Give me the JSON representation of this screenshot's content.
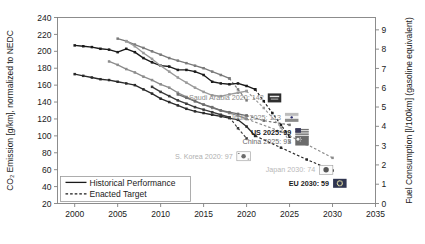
{
  "chart_data": {
    "type": "line",
    "title": "",
    "xlabel": "",
    "ylabel": "CO₂ Emission [g/km], normalized to NEDC",
    "y2label": "Fuel Consumption [l/100km] (gasoline equivalent)",
    "xlim": [
      1998,
      2035
    ],
    "ylim": [
      20,
      240
    ],
    "y2lim": [
      0,
      9.64
    ],
    "grid": false,
    "legend_position": "bottom-left",
    "xticks": [
      2000,
      2005,
      2010,
      2015,
      2020,
      2025,
      2030,
      2035
    ],
    "yticks": [
      20,
      40,
      60,
      80,
      100,
      120,
      140,
      160,
      180,
      200,
      220,
      240
    ],
    "y2ticks": [
      0,
      1,
      2,
      3,
      4,
      5,
      6,
      7,
      8,
      9
    ],
    "legend": [
      {
        "label": "Historical Performance",
        "style": "solid"
      },
      {
        "label": "Enacted Target",
        "style": "dashed"
      }
    ],
    "series": [
      {
        "name": "Saudi Arabia",
        "color": "#7a7a7a",
        "historical": {
          "x": [
            2005,
            2006,
            2007,
            2008,
            2009,
            2010,
            2011,
            2012,
            2013,
            2014,
            2015,
            2016,
            2017,
            2018
          ],
          "y": [
            215,
            212,
            208,
            204,
            200,
            196,
            192,
            189,
            186,
            183,
            180,
            176,
            172,
            168
          ]
        },
        "target": {
          "x": [
            2018,
            2019,
            2020
          ],
          "y": [
            168,
            155,
            142
          ]
        }
      },
      {
        "name": "US",
        "color": "#1a1a1a",
        "historical": {
          "x": [
            2000,
            2001,
            2002,
            2003,
            2004,
            2005,
            2006,
            2007,
            2008,
            2009,
            2010,
            2011,
            2012,
            2013,
            2014,
            2015,
            2016,
            2017,
            2018,
            2019,
            2020,
            2021
          ],
          "y": [
            207,
            206,
            205,
            203,
            202,
            199,
            203,
            199,
            192,
            187,
            183,
            182,
            178,
            178,
            176,
            172,
            164,
            162,
            161,
            162,
            159,
            155
          ]
        },
        "target": {
          "x": [
            2021,
            2022,
            2023,
            2024,
            2025
          ],
          "y": [
            155,
            141,
            127,
            113,
            99
          ]
        }
      },
      {
        "name": "China",
        "color": "#9a9a9a",
        "historical": {
          "x": [
            2006,
            2007,
            2008,
            2009,
            2010,
            2011,
            2012,
            2013,
            2014,
            2015,
            2016,
            2017,
            2018,
            2019,
            2020
          ],
          "y": [
            212,
            206,
            198,
            191,
            183,
            176,
            169,
            163,
            157,
            152,
            148,
            147,
            149,
            151,
            153
          ]
        },
        "target": {
          "x": [
            2020,
            2022,
            2024,
            2025
          ],
          "y": [
            153,
            133,
            110,
            93
          ]
        }
      },
      {
        "name": "EU",
        "color": "#2a2a2a",
        "historical": {
          "x": [
            2000,
            2001,
            2002,
            2003,
            2004,
            2005,
            2006,
            2007,
            2008,
            2009,
            2010,
            2011,
            2012,
            2013,
            2014,
            2015,
            2016,
            2017,
            2018,
            2019,
            2020,
            2021
          ],
          "y": [
            173,
            171,
            169,
            167,
            166,
            164,
            162,
            160,
            155,
            150,
            144,
            140,
            136,
            132,
            129,
            127,
            125,
            123,
            121,
            119,
            111,
            100
          ]
        },
        "target": {
          "x": [
            2021,
            2024,
            2027,
            2030
          ],
          "y": [
            100,
            86,
            72,
            59
          ]
        }
      },
      {
        "name": "Japan",
        "color": "#8c8c8c",
        "historical": {
          "x": [
            2004,
            2005,
            2006,
            2007,
            2008,
            2009,
            2010,
            2011,
            2012,
            2013,
            2014,
            2015,
            2016,
            2017,
            2018,
            2019,
            2020
          ],
          "y": [
            188,
            184,
            179,
            175,
            170,
            166,
            161,
            157,
            151,
            146,
            141,
            137,
            133,
            130,
            127,
            124,
            120
          ]
        },
        "target": {
          "x": [
            2020,
            2024,
            2027,
            2030
          ],
          "y": [
            120,
            105,
            90,
            74
          ]
        }
      },
      {
        "name": "India",
        "color": "#6e6e6e",
        "historical": {
          "x": [
            2012,
            2013,
            2014,
            2015,
            2016,
            2017,
            2018,
            2019,
            2020
          ],
          "y": [
            149,
            145,
            141,
            137,
            134,
            130,
            128,
            126,
            124
          ]
        },
        "target": {
          "x": [
            2020,
            2022,
            2025
          ],
          "y": [
            124,
            118,
            113
          ]
        }
      },
      {
        "name": "S. Korea",
        "color": "#3a3a3a",
        "historical": {
          "x": [
            2009,
            2010,
            2011,
            2012,
            2013,
            2014,
            2015,
            2016,
            2017,
            2018
          ],
          "y": [
            158,
            152,
            147,
            142,
            138,
            134,
            131,
            128,
            125,
            122
          ]
        },
        "target": {
          "x": [
            2018,
            2019,
            2020
          ],
          "y": [
            122,
            109,
            97
          ]
        }
      }
    ],
    "annotations": [
      {
        "id": "saudi-arabia",
        "text": "Saudi Arabia 2020: 142",
        "x": 2022.0,
        "y": 145,
        "color": "#8a8a8a",
        "bold": false,
        "flag": "saudi-arabia"
      },
      {
        "id": "india",
        "text": "India 2025: 113",
        "x": 2024.0,
        "y": 122,
        "color": "#8a8a8a",
        "bold": false,
        "flag": "india"
      },
      {
        "id": "us",
        "text": "US 2025: 99",
        "x": 2025.2,
        "y": 104,
        "color": "#1a1a1a",
        "bold": true,
        "flag": "us"
      },
      {
        "id": "china",
        "text": "China 2025: 93",
        "x": 2025.2,
        "y": 94,
        "color": "#6a6a6a",
        "bold": false,
        "flag": "china"
      },
      {
        "id": "s-korea",
        "text": "S. Korea 2020: 97",
        "x": 2018.4,
        "y": 76,
        "color": "#b0b0b0",
        "bold": false,
        "flag": "s-korea"
      },
      {
        "id": "japan",
        "text": "Japan 2030: 74",
        "x": 2028.0,
        "y": 60,
        "color": "#b8b8b8",
        "bold": false,
        "flag": "japan"
      },
      {
        "id": "eu",
        "text": "EU 2030: 59",
        "x": 2029.6,
        "y": 44,
        "color": "#1a1a1a",
        "bold": true,
        "flag": "eu"
      }
    ]
  }
}
